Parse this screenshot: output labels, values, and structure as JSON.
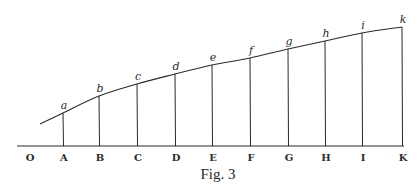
{
  "figure": {
    "caption": "Fig. 3",
    "origin_label": "O",
    "colors": {
      "ink": "#2a2a2a",
      "background": "#ffffff"
    },
    "baseline": {
      "y": 146,
      "x_start": 17,
      "x_end": 404
    },
    "curve_start": {
      "x": 40,
      "y": 124
    },
    "ordinates": [
      {
        "axis_label": "A",
        "curve_label": "a",
        "x": 63,
        "top_y": 113
      },
      {
        "axis_label": "B",
        "curve_label": "b",
        "x": 99,
        "top_y": 96
      },
      {
        "axis_label": "C",
        "curve_label": "c",
        "x": 137,
        "top_y": 84
      },
      {
        "axis_label": "D",
        "curve_label": "d",
        "x": 175,
        "top_y": 74
      },
      {
        "axis_label": "E",
        "curve_label": "e",
        "x": 212,
        "top_y": 65
      },
      {
        "axis_label": "F",
        "curve_label": "f",
        "x": 250,
        "top_y": 58
      },
      {
        "axis_label": "G",
        "curve_label": "g",
        "x": 288,
        "top_y": 49
      },
      {
        "axis_label": "H",
        "curve_label": "h",
        "x": 325,
        "top_y": 41
      },
      {
        "axis_label": "I",
        "curve_label": "i",
        "x": 362,
        "top_y": 33
      },
      {
        "axis_label": "K",
        "curve_label": "k",
        "x": 402,
        "top_y": 27
      }
    ]
  }
}
